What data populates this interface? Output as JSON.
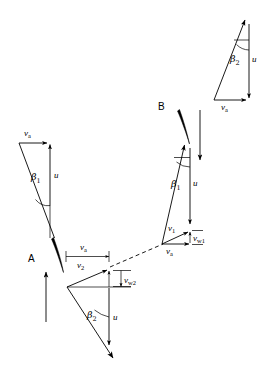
{
  "figure": {
    "type": "vector-velocity-triangle-diagram",
    "background_color": "#ffffff",
    "line_color": "#000000",
    "blade_color": "#000000"
  },
  "stations": [
    {
      "key": "A",
      "label": "A"
    },
    {
      "key": "B",
      "label": "B"
    }
  ],
  "labels": {
    "va": "v",
    "va_sub": "a",
    "u": "u",
    "v1": "v",
    "v1_sub": "1",
    "v2": "v",
    "v2_sub": "2",
    "vw1": "v",
    "vw1_sub": "w1",
    "vw2": "v",
    "vw2_sub": "w2",
    "beta1": "β",
    "beta1_sub": "1",
    "beta2": "β",
    "beta2_sub": "2"
  },
  "triangles": [
    {
      "name": "upper-left-inlet-triangle",
      "station": "A",
      "vectors": [
        "va",
        "u",
        "beta1"
      ],
      "va_direction": "right",
      "u_direction": "up",
      "angle_label": "beta1"
    },
    {
      "name": "lower-left-outlet-triangle",
      "station": "A",
      "vectors": [
        "va",
        "v2",
        "vw2",
        "u",
        "beta2"
      ],
      "va_direction": "right",
      "u_direction": "down",
      "angle_label": "beta2"
    },
    {
      "name": "lower-right-inlet-triangle",
      "station": "B",
      "vectors": [
        "va",
        "v1",
        "vw1",
        "u",
        "beta1"
      ],
      "va_direction": "right",
      "u_direction": "down",
      "angle_label": "beta1"
    },
    {
      "name": "upper-right-outlet-triangle",
      "station": "B",
      "vectors": [
        "va",
        "u",
        "beta2"
      ],
      "va_direction": "right",
      "u_direction": "down",
      "angle_label": "beta2"
    }
  ],
  "connector": {
    "name": "dashed-flow-connector",
    "style": "dashed",
    "from": "station-A-v2-tip",
    "to": "station-B-triangle-apex"
  },
  "flow_arrows": [
    {
      "name": "flow-arrow-A",
      "direction": "up"
    },
    {
      "name": "flow-arrow-B",
      "direction": "down"
    }
  ]
}
